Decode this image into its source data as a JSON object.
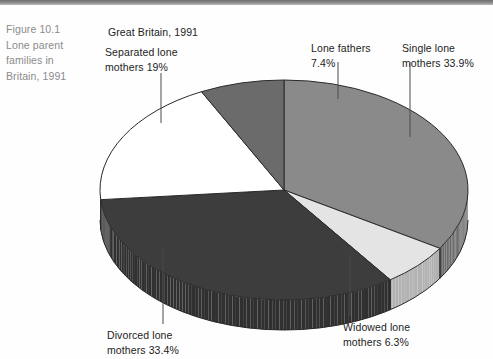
{
  "caption": {
    "lines": [
      "Figure 10.1",
      "Lone parent",
      "families in",
      "Britain, 1991"
    ]
  },
  "chart_title": "Great Britain, 1991",
  "labels": {
    "separated": "Separated lone\nmothers 19%",
    "fathers": "Lone fathers\n7.4%",
    "single": "Single lone\nmothers 33.9%",
    "divorced": "Divorced lone\nmothers 33.4%",
    "widowed": "Widowed lone\nmothers 6.3%"
  },
  "chart_data": {
    "type": "pie",
    "title": "Great Britain, 1991",
    "subtitle": "Figure 10.1 Lone parent families in Britain, 1991",
    "three_d": true,
    "legend": "labels-with-leader-lines",
    "unit": "percent",
    "categories": [
      "Single lone mothers",
      "Widowed lone mothers",
      "Divorced lone mothers",
      "Separated lone mothers",
      "Lone fathers"
    ],
    "values": [
      33.9,
      6.3,
      33.4,
      19.0,
      7.4
    ],
    "slices": [
      {
        "label": "Single lone mothers",
        "value": 33.9,
        "color": "#8a8a8a"
      },
      {
        "label": "Widowed lone mothers",
        "value": 6.3,
        "color": "#e4e4e4"
      },
      {
        "label": "Divorced lone mothers",
        "value": 33.4,
        "color": "#3d3d3d"
      },
      {
        "label": "Separated lone mothers",
        "value": 19.0,
        "color": "#ffffff"
      },
      {
        "label": "Lone fathers",
        "value": 7.4,
        "color": "#6b6b6b"
      }
    ],
    "colors": {
      "single": "#8a8a8a",
      "widowed": "#e4e4e4",
      "divorced": "#3d3d3d",
      "separated": "#ffffff",
      "fathers": "#6b6b6b",
      "outline": "#2a2a2a"
    }
  }
}
